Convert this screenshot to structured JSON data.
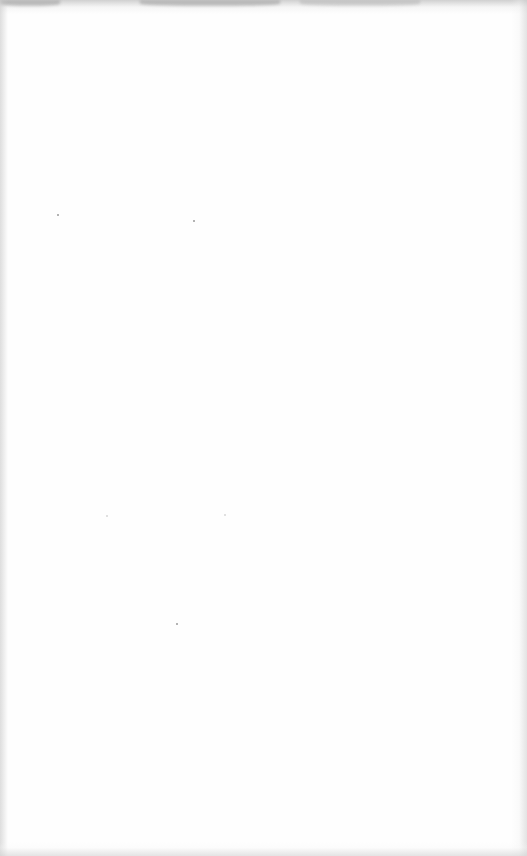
{
  "document": {
    "type": "blank-scanned-page",
    "text": "",
    "background_color": "#fefefe",
    "edge_shadow_color": "#c8c8c8"
  }
}
